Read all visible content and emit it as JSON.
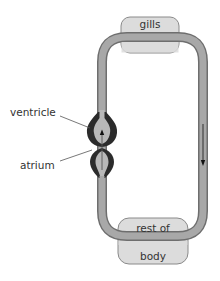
{
  "diagram": {
    "labels": {
      "gills": "gills",
      "rest_of": "rest of",
      "body": "body",
      "ventricle": "ventricle",
      "atrium": "atrium"
    },
    "colors": {
      "vessel_fill": "#a8a8a8",
      "vessel_edge": "#6e6e6e",
      "organ_fill": "#dcdcdc",
      "organ_edge": "#7a7a7a",
      "heart_wall": "#2b2b2b",
      "text": "#333333",
      "arrow": "#222222"
    },
    "flow_direction": "down (right vessel), up (through heart)"
  }
}
